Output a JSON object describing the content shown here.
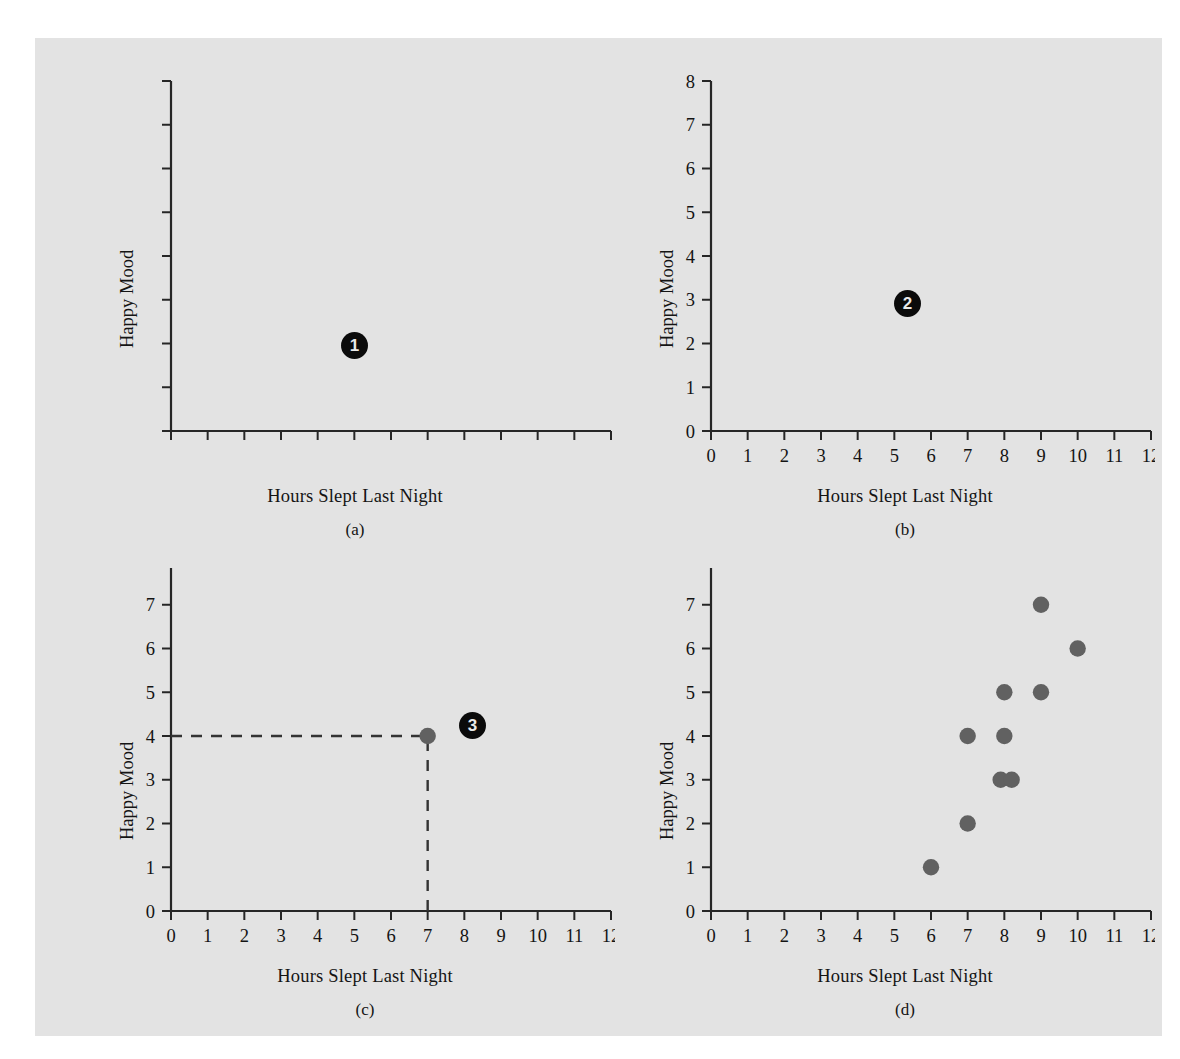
{
  "figure": {
    "background_color": "#e3e3e3",
    "page_color": "#ffffff",
    "axis_color": "#262626",
    "point_color": "#616161",
    "badge_color": "#0b0b0b"
  },
  "labels": {
    "xlabel": "Hours Slept Last Night",
    "ylabel": "Happy Mood",
    "caption_a": "(a)",
    "caption_b": "(b)",
    "caption_c": "(c)",
    "caption_d": "(d)",
    "badge_1": "1",
    "badge_2": "2",
    "badge_3": "3"
  },
  "chart_data": [
    {
      "id": "a",
      "type": "scatter",
      "title": "(a)",
      "xlabel": "Hours Slept Last Night",
      "ylabel": "Happy Mood",
      "xlim": [
        0,
        12
      ],
      "ylim": [
        0,
        8
      ],
      "xticks": [
        0,
        1,
        2,
        3,
        4,
        5,
        6,
        7,
        8,
        9,
        10,
        11,
        12
      ],
      "yticks": [
        0,
        1,
        2,
        3,
        4,
        5,
        6,
        7,
        8
      ],
      "xticklabels": [
        "",
        "",
        "",
        "",
        "",
        "",
        "",
        "",
        "",
        "",
        "",
        "",
        ""
      ],
      "yticklabels": [
        "",
        "",
        "",
        "",
        "",
        "",
        "",
        "",
        ""
      ],
      "grid": false,
      "legend": false,
      "points": [],
      "annotation_badge": "1"
    },
    {
      "id": "b",
      "type": "scatter",
      "title": "(b)",
      "xlabel": "Hours Slept Last Night",
      "ylabel": "Happy Mood",
      "xlim": [
        0,
        12
      ],
      "ylim": [
        0,
        8
      ],
      "xticks": [
        0,
        1,
        2,
        3,
        4,
        5,
        6,
        7,
        8,
        9,
        10,
        11,
        12
      ],
      "yticks": [
        0,
        1,
        2,
        3,
        4,
        5,
        6,
        7,
        8
      ],
      "xticklabels": [
        "0",
        "1",
        "2",
        "3",
        "4",
        "5",
        "6",
        "7",
        "8",
        "9",
        "10",
        "11",
        "12"
      ],
      "yticklabels": [
        "0",
        "1",
        "2",
        "3",
        "4",
        "5",
        "6",
        "7",
        "8"
      ],
      "grid": false,
      "legend": false,
      "points": [],
      "annotation_badge": "2"
    },
    {
      "id": "c",
      "type": "scatter",
      "title": "(c)",
      "xlabel": "Hours Slept Last Night",
      "ylabel": "Happy Mood",
      "xlim": [
        0,
        12
      ],
      "ylim": [
        0,
        8
      ],
      "xticks": [
        0,
        1,
        2,
        3,
        4,
        5,
        6,
        7,
        8,
        9,
        10,
        11,
        12
      ],
      "yticks": [
        0,
        1,
        2,
        3,
        4,
        5,
        6,
        7,
        8
      ],
      "xticklabels": [
        "0",
        "1",
        "2",
        "3",
        "4",
        "5",
        "6",
        "7",
        "8",
        "9",
        "10",
        "11",
        "12"
      ],
      "yticklabels": [
        "0",
        "1",
        "2",
        "3",
        "4",
        "5",
        "6",
        "7",
        "8"
      ],
      "grid": false,
      "legend": false,
      "points": [
        [
          7,
          4
        ]
      ],
      "guide_lines": [
        {
          "from": [
            0,
            4
          ],
          "to": [
            7,
            4
          ],
          "style": "dashed"
        },
        {
          "from": [
            7,
            0
          ],
          "to": [
            7,
            4
          ],
          "style": "dashed"
        }
      ],
      "annotation_badge": "3"
    },
    {
      "id": "d",
      "type": "scatter",
      "title": "(d)",
      "xlabel": "Hours Slept Last Night",
      "ylabel": "Happy Mood",
      "xlim": [
        0,
        12
      ],
      "ylim": [
        0,
        8
      ],
      "xticks": [
        0,
        1,
        2,
        3,
        4,
        5,
        6,
        7,
        8,
        9,
        10,
        11,
        12
      ],
      "yticks": [
        0,
        1,
        2,
        3,
        4,
        5,
        6,
        7,
        8
      ],
      "xticklabels": [
        "0",
        "1",
        "2",
        "3",
        "4",
        "5",
        "6",
        "7",
        "8",
        "9",
        "10",
        "11",
        "12"
      ],
      "yticklabels": [
        "0",
        "1",
        "2",
        "3",
        "4",
        "5",
        "6",
        "7",
        "8"
      ],
      "grid": false,
      "legend": false,
      "points": [
        [
          6,
          1
        ],
        [
          7,
          2
        ],
        [
          7,
          4
        ],
        [
          7.9,
          3
        ],
        [
          8.2,
          3
        ],
        [
          8,
          4
        ],
        [
          8,
          5
        ],
        [
          9,
          5
        ],
        [
          9,
          7
        ],
        [
          10,
          6
        ]
      ]
    }
  ]
}
